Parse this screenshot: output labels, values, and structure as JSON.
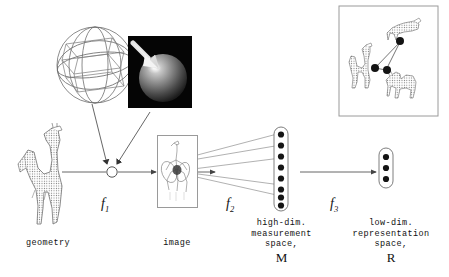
{
  "diagram": {
    "stages": [
      {
        "id": "geometry",
        "label": "geometry"
      },
      {
        "id": "image",
        "label": "image"
      },
      {
        "id": "high-dim",
        "label": "high-dim.\nmeasurement\nspace,",
        "symbol": "M"
      },
      {
        "id": "low-dim",
        "label": "low-dim.\nrepresentation\nspace,",
        "symbol": "R"
      }
    ],
    "maps": [
      {
        "id": "f1",
        "label": "f",
        "sub": "1"
      },
      {
        "id": "f2",
        "label": "f",
        "sub": "2"
      },
      {
        "id": "f3",
        "label": "f",
        "sub": "3"
      }
    ],
    "objects": {
      "wire_sphere": "wireframe-sphere",
      "rendered_sphere": "rendered-lit-sphere",
      "light_arrow": "light-direction-arrow",
      "geometry_model": "giraffe-wireframe-model",
      "image_render": "giraffe-rendered-image",
      "inset": "low-dim-embedding-inset"
    },
    "high_dim_dot_count": 8,
    "low_dim_dot_count": 3,
    "inset": {
      "animals": [
        "giraffe",
        "camel",
        "bull"
      ],
      "dot_count": 3
    },
    "colors": {
      "ink": "#1a1a1a",
      "line": "#555555",
      "frame": "#9a9a9a",
      "raster_bg": "#000000",
      "dot": "#111111"
    }
  }
}
